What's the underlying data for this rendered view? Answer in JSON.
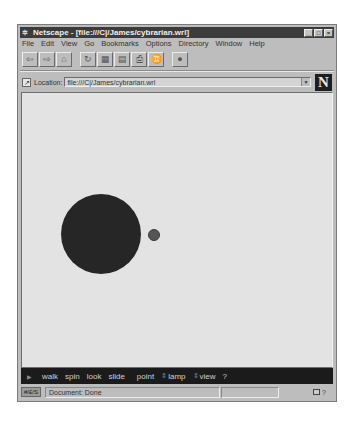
{
  "window": {
    "app_icon": "netscape-icon",
    "title": "Netscape - [file:///C|/James/cybrarian.wrl]",
    "controls": {
      "minimize": "_",
      "maximize": "□",
      "close": "×"
    }
  },
  "menubar": {
    "items": [
      {
        "label": "File"
      },
      {
        "label": "Edit"
      },
      {
        "label": "View"
      },
      {
        "label": "Go"
      },
      {
        "label": "Bookmarks"
      },
      {
        "label": "Options"
      },
      {
        "label": "Directory"
      },
      {
        "label": "Window"
      },
      {
        "label": "Help"
      }
    ]
  },
  "toolbar": {
    "buttons": [
      {
        "name": "back",
        "icon": "⇦"
      },
      {
        "name": "forward",
        "icon": "⇨"
      },
      {
        "name": "home",
        "icon": "⌂"
      },
      {
        "name": "reload",
        "icon": "↻"
      },
      {
        "name": "images",
        "icon": "▦"
      },
      {
        "name": "open",
        "icon": "▤"
      },
      {
        "name": "print",
        "icon": "⎙"
      },
      {
        "name": "find",
        "icon": "♊"
      },
      {
        "name": "stop",
        "icon": "●"
      }
    ]
  },
  "location": {
    "label": "Location:",
    "value": "file:///C|/James/cybrarian.wrl",
    "dropdown_glyph": "▼",
    "logo": "N"
  },
  "vrml_nav": {
    "play_glyph": "▶",
    "items": [
      {
        "label": "walk"
      },
      {
        "label": "spin"
      },
      {
        "label": "look"
      },
      {
        "label": "slide"
      },
      {
        "label": "point"
      },
      {
        "label": "lamp",
        "prefix": "⇕"
      },
      {
        "label": "view",
        "prefix": "⇕"
      },
      {
        "label": "?"
      }
    ]
  },
  "status": {
    "security_icon": "key-icon",
    "security_label": "#/£/S",
    "text": "Document: Done",
    "progress": "",
    "help_glyph": "?"
  },
  "scene": {
    "background": "#e3e3e3",
    "big_sphere_color": "#262626",
    "small_sphere_color": "#555555"
  }
}
